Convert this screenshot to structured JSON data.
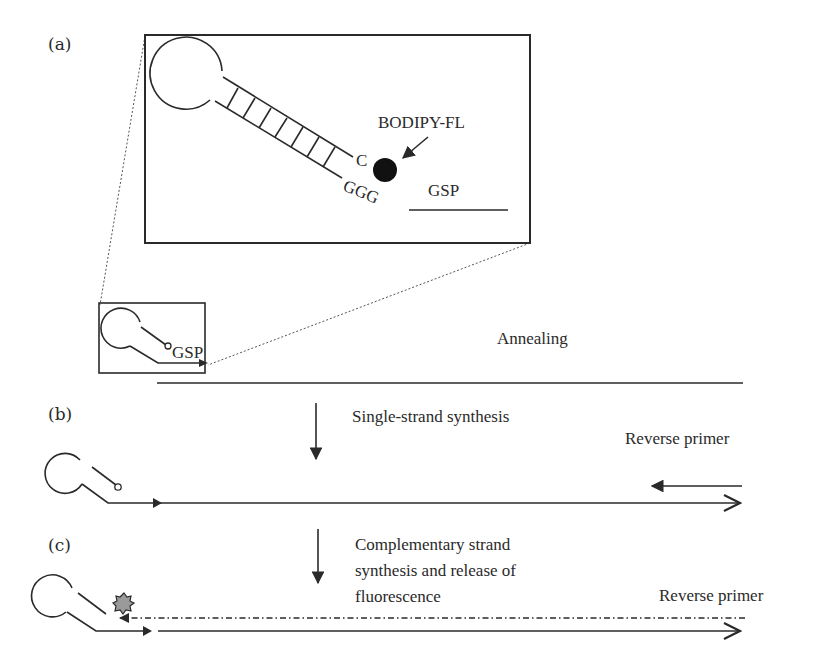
{
  "panels": {
    "a": {
      "label": "(a)",
      "inset": {
        "fluorophore_label": "BODIPY-FL",
        "base_c": "C",
        "base_ggg": "GGG",
        "primer_label": "GSP"
      },
      "small_probe_label": "GSP",
      "step_label": "Annealing"
    },
    "b": {
      "label": "(b)",
      "step_label": "Single-strand synthesis",
      "primer_label": "Reverse primer"
    },
    "c": {
      "label": "(c)",
      "step_label_lines": [
        "Complementary strand",
        "synthesis and release of",
        "fluorescence"
      ],
      "primer_label": "Reverse primer"
    }
  },
  "colors": {
    "ink": "#2a2a2a",
    "fluorophore": "#111111",
    "released_fluor": "#888888"
  }
}
